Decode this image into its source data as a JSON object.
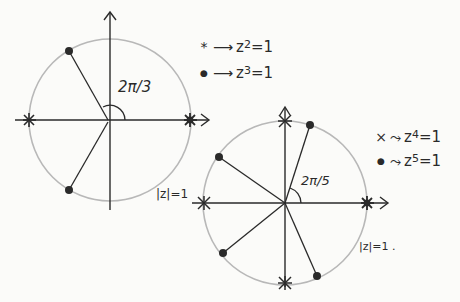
{
  "diagram": {
    "colors": {
      "ink": "#2a2a2a",
      "circle": "#b8b8b8",
      "paper": "#fbfbf9"
    },
    "figures": [
      {
        "id": "left",
        "angle_label": "2π/3",
        "circle_label": "|z|=1",
        "legend": [
          {
            "symbol": "*",
            "arrow": "⟶",
            "equation_base": "z",
            "equation_exp": "2",
            "equation_rhs": "=1"
          },
          {
            "symbol": "●",
            "arrow": "⟶",
            "equation_base": "z",
            "equation_exp": "3",
            "equation_rhs": "=1"
          }
        ]
      },
      {
        "id": "right",
        "angle_label": "2π/5",
        "circle_label": "|z|=1 .",
        "legend": [
          {
            "symbol": "×",
            "arrow": "⤳",
            "equation_base": "z",
            "equation_exp": "4",
            "equation_rhs": "=1"
          },
          {
            "symbol": "●",
            "arrow": "⤳",
            "equation_base": "z",
            "equation_exp": "5",
            "equation_rhs": "=1"
          }
        ]
      }
    ]
  }
}
